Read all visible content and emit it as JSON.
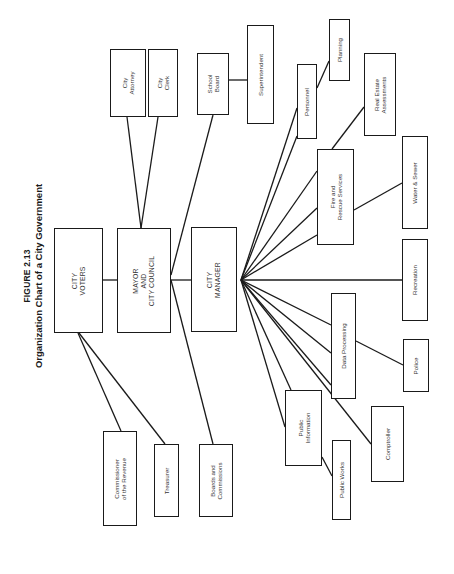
{
  "figure": {
    "number": "FIGURE 2.13",
    "title": "Organization Chart of a City Government"
  },
  "nodes": {
    "city_voters": {
      "label": "CITY\nVOTERS",
      "x": 54,
      "y": 228,
      "w": 49,
      "h": 105
    },
    "mayor_council": {
      "label": "MAYOR\nAND\nCITY COUNCIL",
      "x": 117,
      "y": 228,
      "w": 54,
      "h": 105
    },
    "city_manager": {
      "label": "CITY\nMANAGER",
      "x": 191,
      "y": 227,
      "w": 46,
      "h": 105
    },
    "commissioner_revenue": {
      "label": "Commissioner\nof the Revenue",
      "x": 103,
      "y": 431,
      "w": 34,
      "h": 95
    },
    "treasurer": {
      "label": "Treasurer",
      "x": 154,
      "y": 444,
      "w": 25,
      "h": 73
    },
    "boards_commissions": {
      "label": "Boards and\nCommissions",
      "x": 199,
      "y": 444,
      "w": 34,
      "h": 73
    },
    "city_attorney": {
      "label": "City\nAttorney",
      "x": 110,
      "y": 49,
      "w": 36,
      "h": 68
    },
    "city_clerk": {
      "label": "City\nClerk",
      "x": 148,
      "y": 49,
      "w": 30,
      "h": 68
    },
    "school_board": {
      "label": "School\nBoard",
      "x": 197,
      "y": 53,
      "w": 32,
      "h": 62
    },
    "superintendent": {
      "label": "Superintendent",
      "x": 247,
      "y": 25,
      "w": 27,
      "h": 99
    },
    "personnel": {
      "label": "Personnel",
      "x": 297,
      "y": 64,
      "w": 20,
      "h": 75
    },
    "planning": {
      "label": "Planning",
      "x": 329,
      "y": 19,
      "w": 21,
      "h": 62
    },
    "real_estate": {
      "label": "Real Estate\nAssessments",
      "x": 364,
      "y": 53,
      "w": 32,
      "h": 83
    },
    "fire_rescue": {
      "label": "Fire and\nRescue Services",
      "x": 317,
      "y": 149,
      "w": 37,
      "h": 96
    },
    "water_sewer": {
      "label": "Water & Sewer",
      "x": 402,
      "y": 136,
      "w": 26,
      "h": 93
    },
    "recreation": {
      "label": "Recreation",
      "x": 402,
      "y": 239,
      "w": 26,
      "h": 82
    },
    "data_processing": {
      "label": "Data Processing",
      "x": 331,
      "y": 293,
      "w": 25,
      "h": 106
    },
    "police": {
      "label": "Police",
      "x": 403,
      "y": 339,
      "w": 26,
      "h": 53
    },
    "public_information": {
      "label": "Public\nInformation",
      "x": 285,
      "y": 390,
      "w": 37,
      "h": 76
    },
    "public_works": {
      "label": "Public Works",
      "x": 332,
      "y": 440,
      "w": 19,
      "h": 80
    },
    "comptroller": {
      "label": "Comptroller",
      "x": 371,
      "y": 406,
      "w": 33,
      "h": 76
    }
  },
  "links": [
    {
      "from": "city_voters",
      "to": "mayor_council",
      "x1": 103,
      "y1": 280,
      "x2": 117,
      "y2": 280
    },
    {
      "from": "mayor_council",
      "to": "city_manager",
      "x1": 171,
      "y1": 280,
      "x2": 191,
      "y2": 280
    },
    {
      "from": "city_voters",
      "to": "commissioner_revenue",
      "x1": 78,
      "y1": 333,
      "x2": 121,
      "y2": 431
    },
    {
      "from": "city_voters",
      "to": "treasurer",
      "x1": 79,
      "y1": 333,
      "x2": 165,
      "y2": 444
    },
    {
      "from": "mayor_council",
      "to": "boards_commissions",
      "x1": 171,
      "y1": 280,
      "x2": 213,
      "y2": 444
    },
    {
      "from": "mayor_council",
      "to": "city_attorney",
      "x1": 141,
      "y1": 228,
      "x2": 127,
      "y2": 117
    },
    {
      "from": "mayor_council",
      "to": "city_clerk",
      "x1": 141,
      "y1": 228,
      "x2": 158,
      "y2": 117
    },
    {
      "from": "mayor_council",
      "to": "school_board",
      "x1": 171,
      "y1": 275,
      "x2": 213,
      "y2": 115
    },
    {
      "from": "school_board",
      "to": "superintendent",
      "x1": 229,
      "y1": 80,
      "x2": 247,
      "y2": 80
    },
    {
      "from": "city_manager",
      "to": "personnel",
      "x1": 241,
      "y1": 280,
      "x2": 297,
      "y2": 108
    },
    {
      "from": "city_manager",
      "to": "personnel",
      "x1": 241,
      "y1": 280,
      "x2": 297,
      "y2": 136
    },
    {
      "from": "personnel",
      "to": "planning",
      "x1": 317,
      "y1": 88,
      "x2": 329,
      "y2": 61
    },
    {
      "from": "city_manager",
      "to": "fire_rescue",
      "x1": 241,
      "y1": 280,
      "x2": 317,
      "y2": 171
    },
    {
      "from": "city_manager",
      "to": "fire_rescue",
      "x1": 241,
      "y1": 280,
      "x2": 317,
      "y2": 208
    },
    {
      "from": "city_manager",
      "to": "fire_rescue",
      "x1": 241,
      "y1": 280,
      "x2": 317,
      "y2": 235
    },
    {
      "from": "fire_rescue",
      "to": "real_estate",
      "x1": 332,
      "y1": 149,
      "x2": 364,
      "y2": 107
    },
    {
      "from": "fire_rescue",
      "to": "water_sewer",
      "x1": 354,
      "y1": 210,
      "x2": 402,
      "y2": 183
    },
    {
      "from": "city_manager",
      "to": "recreation",
      "x1": 241,
      "y1": 280,
      "x2": 402,
      "y2": 280
    },
    {
      "from": "city_manager",
      "to": "data_processing",
      "x1": 241,
      "y1": 280,
      "x2": 331,
      "y2": 325
    },
    {
      "from": "city_manager",
      "to": "data_processing",
      "x1": 241,
      "y1": 280,
      "x2": 331,
      "y2": 353
    },
    {
      "from": "city_manager",
      "to": "data_processing",
      "x1": 241,
      "y1": 280,
      "x2": 331,
      "y2": 385
    },
    {
      "from": "data_processing",
      "to": "police",
      "x1": 356,
      "y1": 341,
      "x2": 403,
      "y2": 365
    },
    {
      "from": "city_manager",
      "to": "public_information",
      "x1": 241,
      "y1": 280,
      "x2": 291,
      "y2": 390
    },
    {
      "from": "city_manager",
      "to": "public_information",
      "x1": 241,
      "y1": 280,
      "x2": 285,
      "y2": 427
    },
    {
      "from": "public_information",
      "to": "public_works",
      "x1": 322,
      "y1": 457,
      "x2": 332,
      "y2": 476
    },
    {
      "from": "city_manager",
      "to": "comptroller",
      "x1": 241,
      "y1": 280,
      "x2": 371,
      "y2": 444
    }
  ]
}
